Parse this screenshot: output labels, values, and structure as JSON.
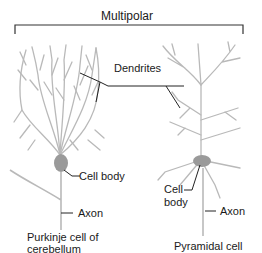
{
  "title": "Multipolar",
  "left_neuron": {
    "caption_line1": "Purkinje cell of",
    "caption_line2": "cerebellum",
    "labels": {
      "dendrites": "Dendrites",
      "cell_body": "Cell body",
      "axon": "Axon"
    }
  },
  "right_neuron": {
    "caption": "Pyramidal cell",
    "labels": {
      "cell_line1": "Cell",
      "cell_line2": "body",
      "axon": "Axon"
    }
  },
  "colors": {
    "neuron": "#b9b9b9",
    "cell_body": "#9a9a9a",
    "leader": "#222222",
    "bracket": "#333333"
  }
}
